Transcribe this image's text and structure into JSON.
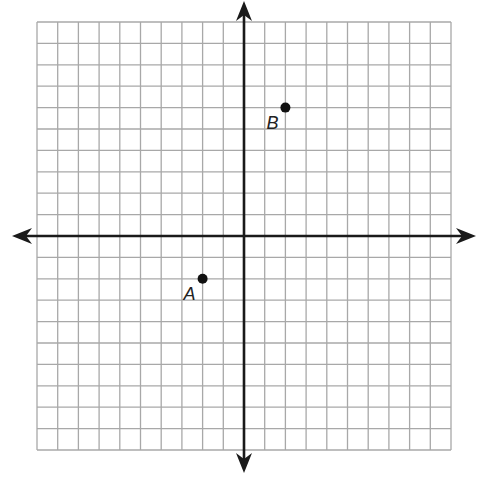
{
  "diagram": {
    "type": "coordinate-plane",
    "grid": {
      "left": 37,
      "top": 22,
      "right": 451,
      "bottom": 450,
      "cols": 20,
      "rows": 20,
      "line_color": "#a8a8a8",
      "axis_color": "#1a1a1a"
    },
    "axes": {
      "origin_px": [
        244,
        236
      ],
      "x_range": [
        -10,
        10
      ],
      "y_range": [
        -10,
        10
      ],
      "x_arrow_extent": [
        12,
        476
      ],
      "y_arrow_extent": [
        1,
        473
      ]
    },
    "points": [
      {
        "label": "A",
        "x": -2,
        "y": -2,
        "label_dx": -19,
        "label_dy": 21
      },
      {
        "label": "B",
        "x": 2,
        "y": 6,
        "label_dx": -19,
        "label_dy": 21
      }
    ]
  }
}
